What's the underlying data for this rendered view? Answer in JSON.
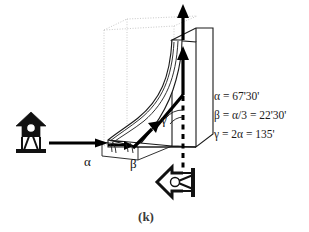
{
  "figure": {
    "caption": "(k)",
    "angle_labels": {
      "alpha": "α",
      "beta": "β",
      "gamma": "γ"
    },
    "equations": [
      "α = 67'30'",
      "β = α/3 = 22'30'",
      "γ = 2α = 135'"
    ],
    "icons": {
      "viewer_left": "viewer-arrow-up-icon",
      "viewer_bottom": "viewer-arrow-left-icon",
      "flow_in_arrow": "inlet-flow-arrow-icon",
      "flow_out_arrow": "outlet-flow-arrow-icon",
      "blade": "curved-blade-shape",
      "bounding_box": "dotted-bounding-box"
    },
    "colors": {
      "background": "#ffffff",
      "ink": "#111111",
      "box_dotted": "#c9c9c9",
      "caption": "#3a3a3a"
    }
  }
}
